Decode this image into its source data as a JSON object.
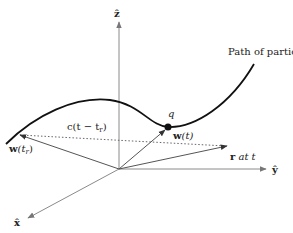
{
  "diagram": {
    "axes": {
      "z_label": "ẑ",
      "y_label": "ŷ",
      "x_label": "x̂"
    },
    "path_label": "Path of particle",
    "charge_label": "q",
    "vectors": {
      "w_tr": "w",
      "w_tr_arg": "(t",
      "w_tr_sub": "r",
      "w_tr_close": ")",
      "w_t": "w",
      "w_t_arg": "(t)",
      "r_label": "r",
      "r_suffix": " at t"
    },
    "separation_label": "c(t − t",
    "separation_sub": "r",
    "separation_close": ")",
    "colors": {
      "axis": "#8a8a8a",
      "curve": "#111111",
      "vector": "#555555",
      "dotted": "#666666"
    }
  }
}
